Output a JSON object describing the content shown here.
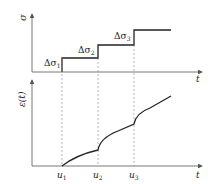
{
  "diagram": {
    "type": "stress-strain step loading diagram",
    "top_plot": {
      "y_axis_label": "σ",
      "x_axis_label": "t",
      "step_labels": [
        "Δσ1",
        "Δσ2",
        "Δσ3"
      ],
      "step_label_parts": [
        {
          "base": "Δσ",
          "sub": "1"
        },
        {
          "base": "Δσ",
          "sub": "2"
        },
        {
          "base": "Δσ",
          "sub": "3"
        }
      ]
    },
    "bottom_plot": {
      "y_axis_label": "ε(t)",
      "x_axis_label": "t",
      "time_markers": [
        {
          "base": "u",
          "sub": "1"
        },
        {
          "base": "u",
          "sub": "2"
        },
        {
          "base": "u",
          "sub": "3"
        }
      ]
    },
    "colors": {
      "line": "#222222",
      "axis": "#555555",
      "dashed": "#888888"
    }
  }
}
